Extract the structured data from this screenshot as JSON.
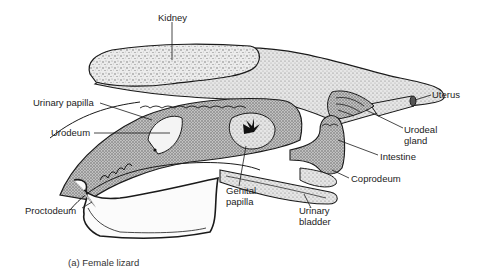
{
  "figure": {
    "caption": "(a) Female lizard"
  },
  "labels": {
    "kidney": "Kidney",
    "urinary_papilla": "Urinary papilla",
    "urodeum": "Urodeum",
    "uterus": "Uterus",
    "urodeal_gland_1": "Urodeal",
    "urodeal_gland_2": "gland",
    "intestine": "Intestine",
    "coprodeum": "Coprodeum",
    "genital_papilla_1": "Genital",
    "genital_papilla_2": "papilla",
    "urinary_bladder_1": "Urinary",
    "urinary_bladder_2": "bladder",
    "proctodeum": "Proctodeum"
  },
  "colors": {
    "line": "#1a1a1a",
    "stipple_light": "#d8d8d8",
    "stipple_mid": "#b9b9b9",
    "stipple_dark": "#8c8c8c",
    "background": "#ffffff"
  }
}
